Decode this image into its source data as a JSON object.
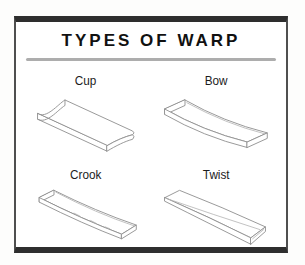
{
  "figure": {
    "title": "TYPES OF WARP",
    "items": [
      {
        "label": "Cup",
        "icon": "cup-warp-board-drawing"
      },
      {
        "label": "Bow",
        "icon": "bow-warp-board-drawing"
      },
      {
        "label": "Crook",
        "icon": "crook-warp-board-drawing"
      },
      {
        "label": "Twist",
        "icon": "twist-warp-board-drawing"
      }
    ]
  },
  "colors": {
    "frame_bar": "#2e2e2e",
    "frame_side": "#4f4f4f",
    "separator_line": "#adadad",
    "drawing_line": "#909090",
    "title_text": "#111111",
    "label_text": "#1c1c1c",
    "background": "#ffffff"
  }
}
